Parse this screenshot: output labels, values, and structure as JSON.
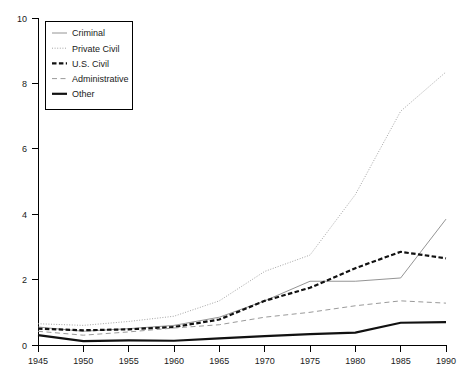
{
  "chart_data": {
    "type": "line",
    "title": "",
    "xlabel": "",
    "ylabel": "",
    "x": [
      1945,
      1950,
      1955,
      1960,
      1965,
      1970,
      1975,
      1980,
      1985,
      1990
    ],
    "xlim": [
      1945,
      1990
    ],
    "ylim": [
      0,
      10
    ],
    "xticks": [
      "1945",
      "1950",
      "1955",
      "1960",
      "1965",
      "1970",
      "1975",
      "1980",
      "1985",
      "1990"
    ],
    "yticks": [
      "0",
      "2",
      "4",
      "6",
      "8",
      "10"
    ],
    "grid": false,
    "legend_position": "top-left",
    "series": [
      {
        "name": "Criminal",
        "style": "solid-thin",
        "color": "#888888",
        "values": [
          0.55,
          0.42,
          0.5,
          0.6,
          0.85,
          1.35,
          1.95,
          1.95,
          2.05,
          3.85
        ]
      },
      {
        "name": "Private Civil",
        "style": "dotted",
        "color": "#9a9a9a",
        "values": [
          0.65,
          0.6,
          0.72,
          0.88,
          1.35,
          2.25,
          2.75,
          4.6,
          7.15,
          8.35
        ]
      },
      {
        "name": "U.S. Civil",
        "style": "dashed-bold",
        "color": "#111111",
        "values": [
          0.5,
          0.45,
          0.48,
          0.55,
          0.78,
          1.35,
          1.75,
          2.35,
          2.85,
          2.65
        ]
      },
      {
        "name": "Administrative",
        "style": "dashed",
        "color": "#9a9a9a",
        "values": [
          0.42,
          0.3,
          0.4,
          0.52,
          0.62,
          0.85,
          1.0,
          1.2,
          1.35,
          1.28
        ]
      },
      {
        "name": "Other",
        "style": "solid-thick",
        "color": "#111111",
        "values": [
          0.3,
          0.12,
          0.14,
          0.13,
          0.2,
          0.27,
          0.33,
          0.38,
          0.68,
          0.7
        ]
      }
    ]
  },
  "axes": {
    "y_axis_name": "value-axis",
    "x_axis_name": "year-axis"
  },
  "caption": {
    "text": ""
  }
}
